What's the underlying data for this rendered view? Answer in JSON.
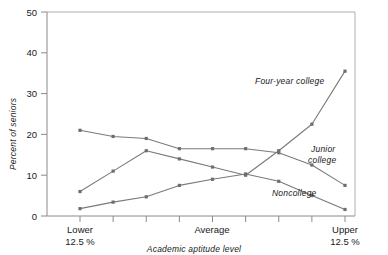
{
  "chart_data": {
    "type": "line",
    "title": "",
    "xlabel": "Academic aptitude level",
    "ylabel": "Percent of seniors",
    "ylim": [
      0,
      50
    ],
    "yticks": [
      0,
      10,
      20,
      30,
      40,
      50
    ],
    "ytick_labels": [
      "0",
      "10",
      "20",
      "30",
      "40",
      "50"
    ],
    "grid": false,
    "legend": "inline-labels",
    "x": [
      1,
      2,
      3,
      4,
      5,
      6,
      7,
      8,
      9
    ],
    "xtick_labels": [
      "",
      "",
      "",
      "",
      "",
      "",
      "",
      "",
      ""
    ],
    "category_labels": [
      {
        "line1": "Lower",
        "line2": "12.5 %",
        "at_x": 1
      },
      {
        "line1": "Average",
        "line2": "",
        "at_x": 5
      },
      {
        "line1": "Upper",
        "line2": "12.5 %",
        "at_x": 9
      }
    ],
    "series": [
      {
        "name": "Junior college",
        "values": [
          21.0,
          19.5,
          19.0,
          16.5,
          16.5,
          16.5,
          15.5,
          12.5,
          7.5
        ]
      },
      {
        "name": "Four-year college",
        "values": [
          6.0,
          11.0,
          16.0,
          14.0,
          12.0,
          10.0,
          16.0,
          22.5,
          35.5
        ]
      },
      {
        "name": "Noncollege",
        "values": [
          1.8,
          3.4,
          4.7,
          7.5,
          9.0,
          10.3,
          8.5,
          5.0,
          1.6
        ]
      }
    ],
    "series_labels": [
      {
        "text": "Four-year college",
        "x": 255,
        "y": 84
      },
      {
        "text": "Junior",
        "x": 311,
        "y": 152
      },
      {
        "text": "college",
        "x": 308,
        "y": 163
      },
      {
        "text": "Noncollege",
        "x": 272,
        "y": 196
      }
    ],
    "colors": {
      "line": "#7a7a7a",
      "marker": "#6e6e6e",
      "axis": "#8a8a8a",
      "text": "#1a1a1a",
      "background": "#ffffff"
    }
  }
}
